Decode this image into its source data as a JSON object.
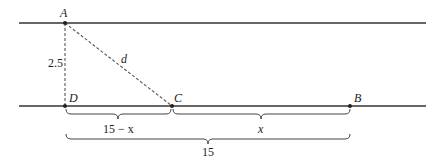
{
  "diagram": {
    "lines": [
      {
        "name": "top-line",
        "y": 23
      },
      {
        "name": "bottom-line",
        "y": 106
      }
    ],
    "points": {
      "A": {
        "label": "A",
        "x": 65,
        "y": 23
      },
      "D": {
        "label": "D",
        "x": 65,
        "y": 106
      },
      "C": {
        "label": "C",
        "x": 172,
        "y": 106
      },
      "B": {
        "label": "B",
        "x": 350,
        "y": 106
      }
    },
    "segment_labels": {
      "AD": "2.5",
      "AC": "d"
    },
    "braces": {
      "DC": "15 − x",
      "CB": "x",
      "DB": "15"
    },
    "colors": {
      "line": "#333333",
      "dashed": "#555555"
    }
  }
}
